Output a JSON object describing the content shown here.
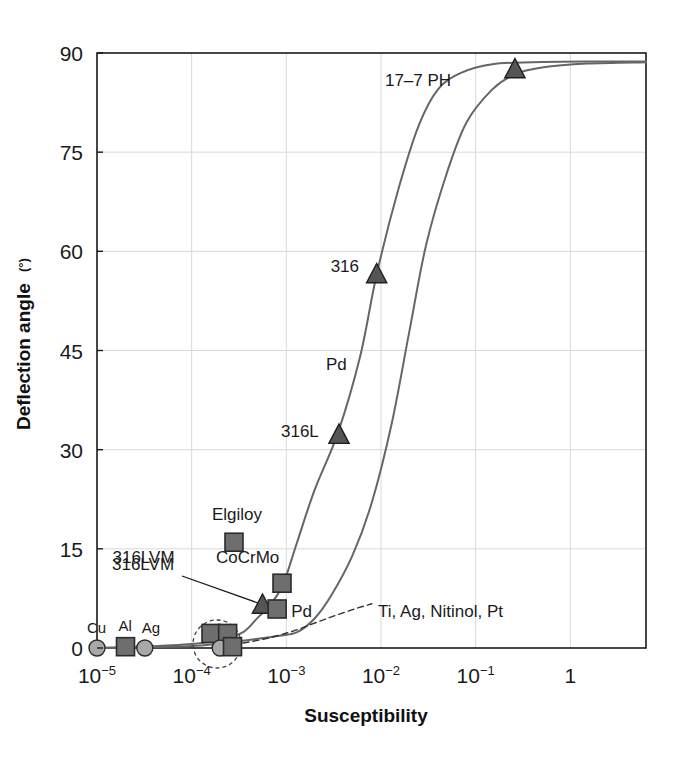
{
  "chart_data": {
    "type": "line",
    "title": "",
    "xlabel": "Susceptibility",
    "ylabel": "Deflection angle (°)",
    "ylabel_base": "Deflection angle",
    "ylabel_unit": "(°)",
    "xscale": "log",
    "xlim": [
      1e-05,
      6.3
    ],
    "ylim": [
      0,
      90
    ],
    "grid": true,
    "legend": "none",
    "yticks": [
      0,
      15,
      30,
      45,
      60,
      75,
      90
    ],
    "ytick_labels": [
      "0",
      "15",
      "30",
      "45",
      "60",
      "75",
      "90"
    ],
    "xticks": [
      1e-05,
      0.0001,
      0.001,
      0.01,
      0.1,
      1
    ],
    "xtick_labels": [
      "10−5",
      "10−4",
      "10−3",
      "10−2",
      "10−1",
      "1"
    ],
    "xtick_mantissas": [
      "10",
      "10",
      "10",
      "10",
      "10",
      "1"
    ],
    "xtick_exponents": [
      "−5",
      "−4",
      "−3",
      "−2",
      "−1",
      ""
    ],
    "series": [
      {
        "name": "upper-curve",
        "style": "solid",
        "color": "#666666",
        "points": [
          [
            1e-05,
            0.0
          ],
          [
            3e-05,
            0.2
          ],
          [
            0.0001,
            0.6
          ],
          [
            0.0002,
            1.2
          ],
          [
            0.00035,
            2.4
          ],
          [
            0.0005,
            4.6
          ],
          [
            0.00065,
            6.2
          ],
          [
            0.0008,
            8.0
          ],
          [
            0.00095,
            10.0
          ],
          [
            0.0013,
            16.0
          ],
          [
            0.002,
            24.0
          ],
          [
            0.0035,
            32.5
          ],
          [
            0.006,
            44.0
          ],
          [
            0.009,
            56.5
          ],
          [
            0.015,
            69.0
          ],
          [
            0.025,
            79.0
          ],
          [
            0.04,
            84.5
          ],
          [
            0.07,
            87.0
          ],
          [
            0.15,
            88.3
          ],
          [
            0.4,
            88.6
          ],
          [
            1.5,
            88.7
          ],
          [
            6.3,
            88.7
          ]
        ]
      },
      {
        "name": "lower-curve",
        "style": "solid",
        "color": "#666666",
        "points": [
          [
            1e-05,
            0.0
          ],
          [
            3e-05,
            0.1
          ],
          [
            0.0001,
            0.3
          ],
          [
            0.0002,
            0.7
          ],
          [
            0.0004,
            1.2
          ],
          [
            0.0008,
            1.8
          ],
          [
            0.0013,
            2.4
          ],
          [
            0.002,
            4.5
          ],
          [
            0.003,
            8.0
          ],
          [
            0.005,
            14.0
          ],
          [
            0.008,
            22.0
          ],
          [
            0.013,
            34.0
          ],
          [
            0.02,
            48.0
          ],
          [
            0.03,
            61.0
          ],
          [
            0.05,
            72.0
          ],
          [
            0.08,
            79.5
          ],
          [
            0.15,
            84.5
          ],
          [
            0.26,
            86.8
          ],
          [
            0.5,
            87.8
          ],
          [
            1.5,
            88.4
          ],
          [
            6.3,
            88.6
          ]
        ]
      },
      {
        "name": "diamagnetic-dashed-line",
        "style": "dashed",
        "color": "#333333",
        "points": [
          [
            0.00017,
            0.0
          ],
          [
            0.0003,
            0.6
          ],
          [
            0.0006,
            1.4
          ],
          [
            0.0012,
            2.6
          ],
          [
            0.0025,
            4.3
          ],
          [
            0.005,
            5.8
          ],
          [
            0.008,
            6.7
          ]
        ]
      }
    ],
    "markers": [
      {
        "label": "Cu",
        "shape": "circle",
        "x": 1e-05,
        "y": 0.0,
        "label_dx": -10,
        "label_dy": -15
      },
      {
        "label": "Al",
        "shape": "square",
        "x": 2e-05,
        "y": 0.2,
        "label_dx": -7,
        "label_dy": -16
      },
      {
        "label": "Ag",
        "shape": "circle",
        "x": 3.2e-05,
        "y": 0.0,
        "label_dx": -3,
        "label_dy": -15
      },
      {
        "label": "",
        "shape": "square",
        "x": 0.00016,
        "y": 2.2,
        "label_dx": 0,
        "label_dy": 0
      },
      {
        "label": "",
        "shape": "square",
        "x": 0.00024,
        "y": 2.2,
        "label_dx": 0,
        "label_dy": 0
      },
      {
        "label": "",
        "shape": "circle",
        "x": 0.0002,
        "y": 0.0,
        "label_dx": 0,
        "label_dy": 0
      },
      {
        "label": "",
        "shape": "square",
        "x": 0.00027,
        "y": 0.2,
        "label_dx": 0,
        "label_dy": 0
      },
      {
        "label": "Elgiloy",
        "shape": "square",
        "x": 0.00028,
        "y": 16.0,
        "label_dx": -22,
        "label_dy": -22
      },
      {
        "label": "CoCrMo",
        "shape": "square",
        "x": 0.0009,
        "y": 9.8,
        "label_dx": -66,
        "label_dy": -20
      },
      {
        "label": "316LVM",
        "shape": "triangle",
        "x": 0.00056,
        "y": 6.5,
        "label_dx": -150,
        "label_dy": -42
      },
      {
        "label": "Pd",
        "shape": "square",
        "x": 0.0008,
        "y": 5.9,
        "label_dx": 14,
        "label_dy": 8
      },
      {
        "label": "316L",
        "shape": "triangle",
        "x": 0.0036,
        "y": 32.2,
        "label_dx": -58,
        "label_dy": 2
      },
      {
        "label": "316",
        "shape": "triangle",
        "x": 0.009,
        "y": 56.5,
        "label_dx": -46,
        "label_dy": -2
      },
      {
        "label": "17–7 PH",
        "shape": "triangle",
        "x": 0.26,
        "y": 87.5,
        "label_dx": -130,
        "label_dy": 16
      }
    ],
    "annotations": [
      {
        "text": "Pd",
        "x_px": 326,
        "y_px": 370,
        "kind": "curve-label"
      },
      {
        "text": "Ti, Ag, Nitinol, Pt",
        "x_px": 378,
        "y_px": 617,
        "kind": "group-label"
      },
      {
        "text": "316LVM",
        "x_px": 112,
        "y_px": 570,
        "kind": "leader-label"
      }
    ],
    "highlight_circle": {
      "cx_px": 217,
      "cy_px": 644,
      "r_px": 24,
      "style": "dashed"
    }
  },
  "figure": {
    "marker_color": "#6e6e6e",
    "marker_edge": "#2b2b2b",
    "circle_color": "#a8a8a8",
    "triangle_color": "#555555",
    "curve_color": "#6a6a6a",
    "axis_color": "#1a1a1a",
    "grid_color": "#d8d8d8",
    "background": "#ffffff"
  }
}
